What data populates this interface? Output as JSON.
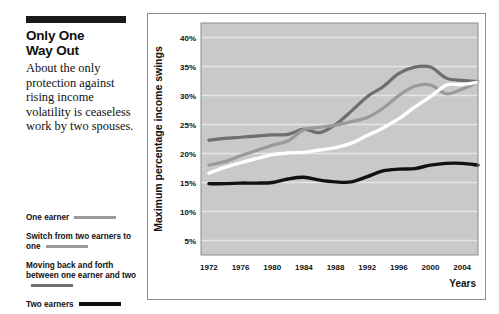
{
  "article": {
    "headline_line1": "Only One",
    "headline_line2": "Way Out",
    "deck": "About the only protection against rising income volatility is ceaseless work by two spouses."
  },
  "legend": {
    "entries": [
      {
        "label": "One earner",
        "color": "#9a9a9a",
        "thickness": 3
      },
      {
        "label": "Switch from two earners to one",
        "color": "#9a9a9a",
        "thickness": 3
      },
      {
        "label": "Moving back and forth between one earner and two",
        "color": "#6e6e6e",
        "thickness": 3
      },
      {
        "label": "Two earners",
        "color": "#111111",
        "thickness": 4
      }
    ]
  },
  "chart_data": {
    "type": "line",
    "title": "",
    "xlabel": "Years",
    "ylabel": "Maximum percentage income swings",
    "xlim": [
      1971,
      2006
    ],
    "ylim": [
      2.5,
      42.5
    ],
    "grid": true,
    "legend_position": "external-left",
    "plot_background": "#c9c9c9",
    "gridline_color": "#e6e6e6",
    "ytick_labels": [
      "5%",
      "10%",
      "15%",
      "20%",
      "25%",
      "30%",
      "35%",
      "40%"
    ],
    "ytick_values": [
      5,
      10,
      15,
      20,
      25,
      30,
      35,
      40
    ],
    "xtick_labels": [
      "1972",
      "1976",
      "1980",
      "1984",
      "1988",
      "1992",
      "1996",
      "2000",
      "2004"
    ],
    "xtick_values": [
      1972,
      1976,
      1980,
      1984,
      1988,
      1992,
      1996,
      2000,
      2004
    ],
    "x": [
      1972,
      1974,
      1976,
      1978,
      1980,
      1982,
      1984,
      1986,
      1988,
      1990,
      1992,
      1994,
      1996,
      1998,
      2000,
      2002,
      2004,
      2006
    ],
    "series": [
      {
        "name": "Moving back and forth between one earner and two",
        "color": "#6e6e6e",
        "width": 3.2,
        "values": [
          22.3,
          22.6,
          22.8,
          23.0,
          23.2,
          23.3,
          24.2,
          23.6,
          25.0,
          27.3,
          29.8,
          31.5,
          33.8,
          34.9,
          34.9,
          33.0,
          32.6,
          32.4
        ]
      },
      {
        "name": "Switch from two earners to one",
        "color": "#9a9a9a",
        "width": 3.2,
        "values": [
          18.0,
          18.6,
          19.6,
          20.5,
          21.4,
          22.2,
          24.1,
          24.5,
          24.9,
          25.5,
          26.2,
          27.8,
          30.0,
          31.6,
          31.8,
          30.3,
          31.1,
          32.3
        ]
      },
      {
        "name": "One earner",
        "color": "#ffffff",
        "width": 3.4,
        "values": [
          16.6,
          17.6,
          18.4,
          19.1,
          19.8,
          20.1,
          20.2,
          20.6,
          21.0,
          21.8,
          23.1,
          24.4,
          26.0,
          28.0,
          29.8,
          31.8,
          31.9,
          32.3
        ]
      },
      {
        "name": "Two earners",
        "color": "#111111",
        "width": 3.4,
        "values": [
          14.8,
          14.8,
          14.9,
          14.9,
          15.0,
          15.6,
          15.9,
          15.4,
          15.1,
          15.1,
          16.0,
          17.0,
          17.3,
          17.4,
          18.0,
          18.3,
          18.3,
          18.0
        ]
      }
    ]
  }
}
